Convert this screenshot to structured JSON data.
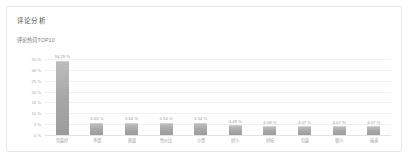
{
  "card": {
    "title": "评论分析"
  },
  "chart_data": {
    "type": "bar",
    "title": "评论热词TOP10",
    "xlabel": "",
    "ylabel": "",
    "ylim": [
      0,
      35
    ],
    "grid": true,
    "legend": false,
    "yticks": [
      "35 %",
      "30 %",
      "25 %",
      "20 %",
      "15 %",
      "10 %",
      "5 %",
      "0 %"
    ],
    "ytick_values": [
      35,
      30,
      25,
      20,
      15,
      10,
      5,
      0
    ],
    "categories": [
      "包装好",
      "不错",
      "质量",
      "性价比",
      "小贵",
      "好小",
      "好吃",
      "包装",
      "很小",
      "味道"
    ],
    "values": [
      34.29,
      5.65,
      5.64,
      5.54,
      5.54,
      4.49,
      4.08,
      4.07,
      4.07,
      4.07
    ],
    "data_labels": [
      "34.29 %",
      "5.65 %",
      "5.64 %",
      "5.54 %",
      "5.54 %",
      "4.49 %",
      "4.08 %",
      "4.07 %",
      "4.07 %",
      "4.07 %"
    ],
    "bar_color": "#a9a9a9"
  }
}
